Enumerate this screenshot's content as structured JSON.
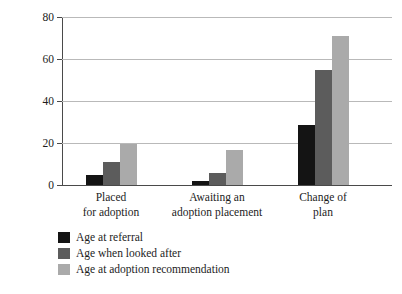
{
  "chart_data": {
    "type": "bar",
    "title": "",
    "subtitle": "",
    "xlabel": "",
    "ylabel": "Mean age in months",
    "ylim": [
      0,
      80
    ],
    "yticks": [
      0,
      20,
      40,
      60,
      80
    ],
    "ytick_labels": [
      "0",
      "20",
      "40",
      "60",
      "80"
    ],
    "grid": true,
    "grid_axis": "y",
    "legend_position": "bottom-left",
    "categories": [
      "Placed\nfor adoption",
      "Awaiting an\nadoption placement",
      "Change of\nplan"
    ],
    "category_lines": [
      [
        "Placed",
        "for adoption"
      ],
      [
        "Awaiting an",
        "adoption placement"
      ],
      [
        "Change of",
        "plan"
      ]
    ],
    "series": [
      {
        "name": "Age at referral",
        "color": "#141414",
        "values": [
          5,
          2,
          28.5
        ]
      },
      {
        "name": "Age when looked after",
        "color": "#5c5c5c",
        "values": [
          11,
          5.5,
          55
        ]
      },
      {
        "name": "Age at adoption recommendation",
        "color": "#aaaaaa",
        "values": [
          19.5,
          16.5,
          71
        ]
      }
    ]
  }
}
